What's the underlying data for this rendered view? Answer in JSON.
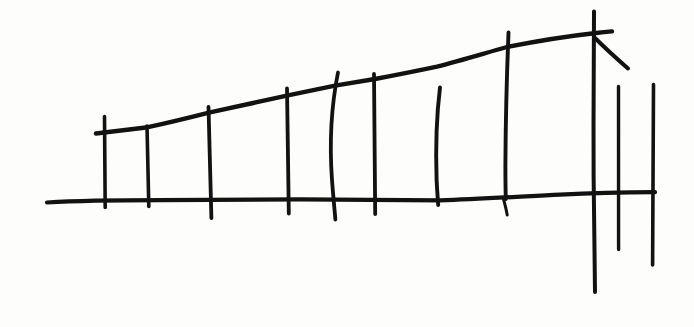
{
  "document": {
    "title": "Hand-drawn perspective fence sketch",
    "medium": "ink-on-paper line drawing",
    "background_color": "#fdfdfc",
    "ink_color": "#121212",
    "canvas": {
      "width": 694,
      "height": 327
    }
  },
  "drawing": {
    "subject": "receding row of fence posts between a ground line and a rising top rail",
    "stroke_count": 14,
    "strokes": [
      {
        "name": "ground-baseline",
        "role": "horizontal ground line running the full width, sagging slightly at centre",
        "stroke_width": 4.2,
        "path": "M47,202.5 C80,200.6 120,200.2 160,200.2 C210,200.0 260,199.6 300,199.4 C350,199.6 400,200.2 440,200.4 C480,199.0 520,196.6 560,194.6 C590,193.2 625,192.4 655,192.2"
      },
      {
        "name": "top-rail-diagonal",
        "role": "long diagonal rail rising from lower-left to upper-right",
        "stroke_width": 4.4,
        "path": "M96,133.5 C115,131.2 132,129.0 148,127.2 C170,122.4 192,117.0 210,112.4 C238,106.2 265,100.4 288,95.4 C305,91.8 321,88.4 335,85.6 C350,83.0 364,80.8 375,79.0 C398,74.6 420,70.2 437,66.6 C462,60.2 486,52.8 507,47.0 C535,41.4 565,36.4 594,33.2 C601,32.4 607,31.8 612,31.4"
      },
      {
        "name": "post-1",
        "role": "leftmost vertical post, extends above the rail",
        "stroke_width": 3.6,
        "path": "M104.5,116.5 C104.8,140 105.0,170 105.2,207.5"
      },
      {
        "name": "post-2",
        "role": "vertical post",
        "stroke_width": 3.6,
        "path": "M147.0,126.0 C147.6,150 148.2,176 148.8,206.5"
      },
      {
        "name": "post-3",
        "role": "vertical post, overshoots below baseline",
        "stroke_width": 3.8,
        "path": "M208.5,107.0 C209.4,135 210.4,170 211.4,218.0"
      },
      {
        "name": "post-4",
        "role": "vertical post rising above the rail",
        "stroke_width": 3.8,
        "path": "M287.0,88.5 C287.6,120 288.2,160 288.8,213.5"
      },
      {
        "name": "post-5",
        "role": "bowed post curving left of vertical",
        "stroke_width": 3.8,
        "path": "M338.0,72.5 C331.5,105 329.5,145 332.0,180 C333.2,196 334.4,208 335.4,219.5"
      },
      {
        "name": "post-6",
        "role": "vertical post rising above the rail",
        "stroke_width": 3.8,
        "path": "M374.0,74.0 C374.4,110 374.8,155 375.2,214.0"
      },
      {
        "name": "post-7",
        "role": "slightly bowed vertical post",
        "stroke_width": 3.9,
        "path": "M440.0,87.5 C436.6,115 435.6,150 436.6,180 C437.2,192 437.8,199 438.2,205.0"
      },
      {
        "name": "post-8",
        "role": "tall vertical post with a thick hooked tail below the baseline",
        "stroke_width": 3.9,
        "path": "M508.5,32.5 C506.8,75 505.6,125 505.4,165 C505.4,181 505.6,192 505.8,199.0"
      },
      {
        "name": "post-8-hook",
        "role": "short thick hooked tail below baseline",
        "stroke_width": 3.0,
        "path": "M503.2,198.0 C504.6,203 506.2,209 507.2,215.0"
      },
      {
        "name": "post-9-tall",
        "role": "tallest post at right, crosses the rail and descends far below the baseline",
        "stroke_width": 4.0,
        "path": "M594.0,11.5 C593.6,60 593.4,120 593.6,175 C593.8,215 594.4,255 595.0,292.0"
      },
      {
        "name": "branch-diagonal",
        "role": "short diagonal branch angling down-right from the tall post",
        "stroke_width": 4.0,
        "path": "M595.0,38.0 C604,47 616,58 628,68.5"
      },
      {
        "name": "short-post-left",
        "role": "free-standing short post right of the tall post",
        "stroke_width": 3.4,
        "path": "M618.5,86.5 C618.3,130 618.3,190 618.6,249.5"
      },
      {
        "name": "short-post-right",
        "role": "rightmost free-standing short post, baseline terminates at it",
        "stroke_width": 3.6,
        "path": "M653.5,84.5 C653.0,130 652.6,195 652.6,265.0"
      }
    ]
  }
}
